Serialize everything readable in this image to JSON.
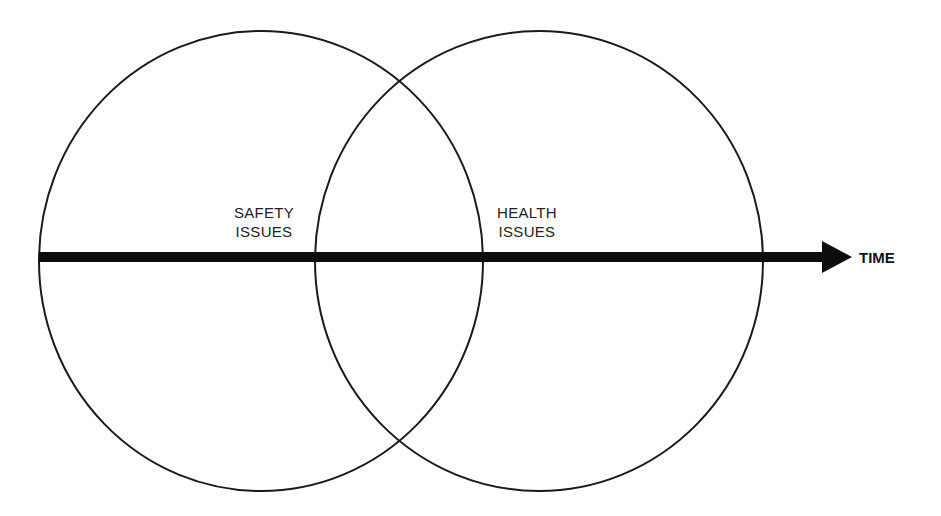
{
  "diagram": {
    "type": "venn-with-timeline",
    "colors": {
      "stroke": "#1a1a1a",
      "background": "#ffffff",
      "text": "#222222"
    },
    "circles": [
      {
        "name": "safety",
        "label_lines": [
          "SAFETY",
          "ISSUES"
        ],
        "cx": 261,
        "cy": 261,
        "rx": 222,
        "ry": 230
      },
      {
        "name": "health",
        "label_lines": [
          "HEALTH",
          "ISSUES"
        ],
        "cx": 539,
        "cy": 261,
        "rx": 224,
        "ry": 230
      }
    ],
    "axis": {
      "label": "TIME",
      "x_start": 39,
      "x_end": 852,
      "y": 257,
      "thickness": 10
    }
  }
}
